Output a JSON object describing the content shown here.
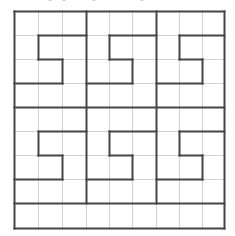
{
  "caption": {
    "visible_text": "",
    "note_fragments_x": [
      48,
      62,
      92,
      140
    ]
  },
  "grid": {
    "columns": 9,
    "rows": 9,
    "col_lines_x": [
      14,
      38,
      62,
      86,
      109,
      132,
      156,
      179,
      202,
      224
    ],
    "row_lines_y": [
      11,
      35,
      59,
      83,
      107,
      131,
      155,
      179,
      203,
      228
    ],
    "thin_color": "#d2d2d2",
    "thick_color": "#454545",
    "thin_width": 1,
    "thick_width": 2
  },
  "regions": {
    "description": "Six S-shaped region boundaries in a 9x9 grid, arranged in two bands of three blocks, with a full-width bottom row",
    "thick_segments_grid": [
      [
        0,
        0,
        9,
        0
      ],
      [
        0,
        9,
        9,
        9
      ],
      [
        0,
        0,
        0,
        9
      ],
      [
        9,
        0,
        9,
        9
      ],
      [
        3,
        0,
        3,
        8
      ],
      [
        6,
        0,
        6,
        8
      ],
      [
        0,
        4,
        9,
        4
      ],
      [
        0,
        8,
        9,
        8
      ],
      [
        1,
        1,
        3,
        1
      ],
      [
        1,
        1,
        1,
        2
      ],
      [
        1,
        2,
        2,
        2
      ],
      [
        2,
        2,
        2,
        3
      ],
      [
        0,
        3,
        2,
        3
      ],
      [
        4,
        1,
        6,
        1
      ],
      [
        4,
        1,
        4,
        2
      ],
      [
        4,
        2,
        5,
        2
      ],
      [
        5,
        2,
        5,
        3
      ],
      [
        3,
        3,
        5,
        3
      ],
      [
        7,
        1,
        9,
        1
      ],
      [
        7,
        1,
        7,
        2
      ],
      [
        7,
        2,
        8,
        2
      ],
      [
        8,
        2,
        8,
        3
      ],
      [
        6,
        3,
        8,
        3
      ],
      [
        1,
        5,
        3,
        5
      ],
      [
        1,
        5,
        1,
        6
      ],
      [
        1,
        6,
        2,
        6
      ],
      [
        2,
        6,
        2,
        7
      ],
      [
        0,
        7,
        2,
        7
      ],
      [
        4,
        5,
        6,
        5
      ],
      [
        4,
        5,
        4,
        6
      ],
      [
        4,
        6,
        5,
        6
      ],
      [
        5,
        6,
        5,
        7
      ],
      [
        3,
        7,
        5,
        7
      ],
      [
        7,
        5,
        9,
        5
      ],
      [
        7,
        5,
        7,
        6
      ],
      [
        7,
        6,
        8,
        6
      ],
      [
        8,
        6,
        8,
        7
      ],
      [
        6,
        7,
        8,
        7
      ]
    ]
  }
}
